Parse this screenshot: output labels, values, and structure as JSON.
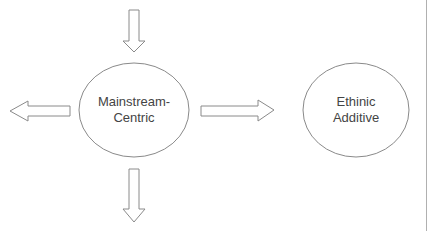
{
  "diagram": {
    "top_caption_partial": "",
    "colors": {
      "stroke": "#8a8a8a",
      "text": "#444444",
      "background": "#ffffff",
      "right_rule": "#b0b0b0"
    },
    "nodes": [
      {
        "id": "mainstream-centric",
        "line1": "Mainstream-",
        "line2": "Centric"
      },
      {
        "id": "ethnic-additive",
        "line1": "Ethinic",
        "line2": "Additive"
      }
    ],
    "arrows": [
      {
        "id": "arrow-in-top",
        "direction": "down",
        "target": "mainstream-centric"
      },
      {
        "id": "arrow-out-left",
        "direction": "left",
        "source": "mainstream-centric"
      },
      {
        "id": "arrow-to-ethnic-additive",
        "direction": "right",
        "source": "mainstream-centric",
        "target": "ethnic-additive"
      },
      {
        "id": "arrow-out-bottom",
        "direction": "down",
        "source": "mainstream-centric"
      }
    ]
  }
}
